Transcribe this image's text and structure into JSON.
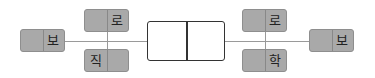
{
  "diagram": {
    "type": "structure-diagram",
    "colors": {
      "node_fill": "#a9a9a9",
      "node_border": "#8e8e8e",
      "connector": "#9a9a9a",
      "center_border": "#333333"
    },
    "left": {
      "outer": {
        "label": "보"
      },
      "top": {
        "label": "로"
      },
      "bottom": {
        "label": "직"
      }
    },
    "center": {
      "left_cell": "",
      "right_cell": ""
    },
    "right": {
      "top": {
        "label": "로"
      },
      "bottom": {
        "label": "학"
      },
      "outer": {
        "label": "보"
      }
    }
  }
}
